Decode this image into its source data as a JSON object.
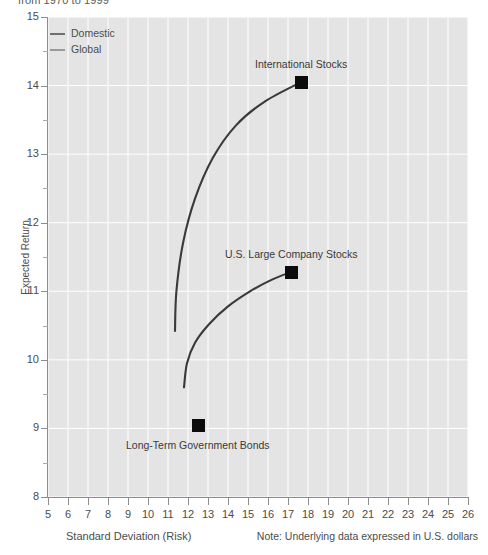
{
  "subtitle": "from 1970 to 1999",
  "chart_data": {
    "type": "scatter",
    "title": "",
    "subtitle": "from 1970 to 1999",
    "xlabel": "Standard Deviation (Risk)",
    "ylabel": "Expected Return",
    "xlim": [
      5,
      26
    ],
    "ylim": [
      8,
      15
    ],
    "xticks": [
      5,
      6,
      7,
      8,
      9,
      10,
      11,
      12,
      13,
      14,
      15,
      16,
      17,
      18,
      19,
      20,
      21,
      22,
      23,
      24,
      25,
      26
    ],
    "yticks": [
      8,
      9,
      10,
      11,
      12,
      13,
      14,
      15
    ],
    "y_minor_ticks": [
      8.5,
      9.5,
      10.5,
      11.5,
      12.5,
      13.5,
      14.5
    ],
    "grid": true,
    "grid_color": "#ffffff",
    "plot_background": "#e4e4e4",
    "legend_position": "top-left",
    "legend": [
      {
        "name": "Domestic",
        "color": "#6f6f6f"
      },
      {
        "name": "Global",
        "color": "#9a9a9a"
      }
    ],
    "annotations": [
      {
        "label": "International Stocks",
        "x": 17.65,
        "y": 14.05,
        "marker": "square",
        "marker_color": "#0c0c0c",
        "label_position": "above"
      },
      {
        "label": "U.S. Large Company Stocks",
        "x": 17.15,
        "y": 11.28,
        "marker": "square",
        "marker_color": "#0c0c0c",
        "label_position": "above"
      },
      {
        "label": "Long-Term Government Bonds",
        "x": 12.5,
        "y": 9.05,
        "marker": "square",
        "marker_color": "#0c0c0c",
        "label_position": "below"
      }
    ],
    "series": [
      {
        "name": "Global",
        "color": "#3a3a3a",
        "description": "Efficient frontier curve rising from (11.35, 10.42) to International Stocks at (17.65, 14.05)",
        "points": [
          {
            "x": 11.35,
            "y": 10.42
          },
          {
            "x": 11.42,
            "y": 11.0
          },
          {
            "x": 11.75,
            "y": 11.7
          },
          {
            "x": 12.35,
            "y": 12.35
          },
          {
            "x": 13.25,
            "y": 12.95
          },
          {
            "x": 14.4,
            "y": 13.42
          },
          {
            "x": 15.8,
            "y": 13.76
          },
          {
            "x": 17.65,
            "y": 14.05
          }
        ]
      },
      {
        "name": "Domestic",
        "color": "#3a3a3a",
        "description": "Efficient frontier curve rising from (11.80, 9.60) to U.S. Large Company Stocks at (17.15, 11.28)",
        "points": [
          {
            "x": 11.8,
            "y": 9.6
          },
          {
            "x": 11.95,
            "y": 9.95
          },
          {
            "x": 12.35,
            "y": 10.25
          },
          {
            "x": 13.05,
            "y": 10.52
          },
          {
            "x": 14.0,
            "y": 10.78
          },
          {
            "x": 15.1,
            "y": 11.0
          },
          {
            "x": 16.2,
            "y": 11.17
          },
          {
            "x": 17.15,
            "y": 11.28
          }
        ]
      }
    ],
    "note": "Note: Underlying data expressed in U.S. dollars"
  }
}
